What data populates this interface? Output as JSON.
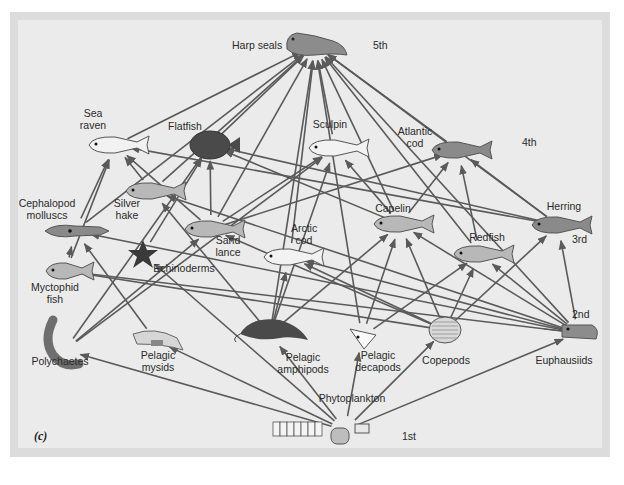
{
  "figure": {
    "panel_label": "(c)",
    "caption_partial": "",
    "colors": {
      "background": "#ebebeb",
      "frame": "#dcdcdc",
      "arrow": "#5a5a5a",
      "text": "#2a2a2a"
    }
  },
  "trophic_levels": [
    {
      "label": "5th",
      "x": 373,
      "y": 49
    },
    {
      "label": "4th",
      "x": 522,
      "y": 146
    },
    {
      "label": "3rd",
      "x": 572,
      "y": 243
    },
    {
      "label": "2nd",
      "x": 572,
      "y": 318
    },
    {
      "label": "1st",
      "x": 402,
      "y": 440
    }
  ],
  "nodes": [
    {
      "id": "harp_seals",
      "label": "Harp seals",
      "icon": "seal-icon",
      "x": 315,
      "y": 45,
      "lx": 232,
      "ly": 49,
      "anchor": "start",
      "level": 5
    },
    {
      "id": "sea_raven",
      "label": "Sea|raven",
      "icon": "fish-icon",
      "x": 115,
      "y": 145,
      "lx": 93,
      "ly": 117,
      "anchor": "middle",
      "level": 4
    },
    {
      "id": "flatfish",
      "label": "Flatfish",
      "icon": "flatfish-icon",
      "x": 210,
      "y": 145,
      "lx": 185,
      "ly": 130,
      "anchor": "middle",
      "level": 4
    },
    {
      "id": "sculpin",
      "label": "Sculpin",
      "icon": "fish-icon",
      "x": 335,
      "y": 148,
      "lx": 330,
      "ly": 128,
      "anchor": "middle",
      "level": 4
    },
    {
      "id": "atlantic_cod",
      "label": "Atlantic|cod",
      "icon": "fish-icon",
      "x": 458,
      "y": 150,
      "lx": 415,
      "ly": 135,
      "anchor": "middle",
      "level": 4
    },
    {
      "id": "cephalopod",
      "label": "Cephalopod|molluscs",
      "icon": "squid-icon",
      "x": 75,
      "y": 231,
      "lx": 47,
      "ly": 207,
      "anchor": "middle",
      "level": 3
    },
    {
      "id": "silver_hake",
      "label": "Silver|hake",
      "icon": "fish-icon",
      "x": 152,
      "y": 191,
      "lx": 127,
      "ly": 207,
      "anchor": "middle",
      "level": 3
    },
    {
      "id": "sand_lance",
      "label": "Sand|lance",
      "icon": "fish-icon",
      "x": 211,
      "y": 229,
      "lx": 228,
      "ly": 244,
      "anchor": "middle",
      "level": 3
    },
    {
      "id": "capelin",
      "label": "Capelin",
      "icon": "fish-icon",
      "x": 400,
      "y": 224,
      "lx": 393,
      "ly": 212,
      "anchor": "middle",
      "level": 3
    },
    {
      "id": "arctic_cod",
      "label": "Arctic|cod",
      "icon": "fish-icon",
      "x": 290,
      "y": 257,
      "lx": 304,
      "ly": 232,
      "anchor": "middle",
      "level": 3
    },
    {
      "id": "redfish",
      "label": "Redfish",
      "icon": "fish-icon",
      "x": 480,
      "y": 254,
      "lx": 487,
      "ly": 241,
      "anchor": "middle",
      "level": 3
    },
    {
      "id": "herring",
      "label": "Herring",
      "icon": "fish-icon",
      "x": 558,
      "y": 225,
      "lx": 564,
      "ly": 210,
      "anchor": "middle",
      "level": 3
    },
    {
      "id": "echinoderms",
      "label": "Echinoderms",
      "icon": "starfish-icon",
      "x": 143,
      "y": 254,
      "lx": 184,
      "ly": 272,
      "anchor": "middle",
      "level": 2
    },
    {
      "id": "myctophid",
      "label": "Myctophid|fish",
      "icon": "fish-icon",
      "x": 66,
      "y": 271,
      "lx": 55,
      "ly": 291,
      "anchor": "middle",
      "level": 3
    },
    {
      "id": "polychaetes",
      "label": "Polychaetes",
      "icon": "worm-icon",
      "x": 65,
      "y": 350,
      "lx": 60,
      "ly": 365,
      "anchor": "middle",
      "level": 2
    },
    {
      "id": "pelagic_mysids",
      "label": "Pelagic|mysids",
      "icon": "shrimp-icon",
      "x": 155,
      "y": 340,
      "lx": 158,
      "ly": 359,
      "anchor": "middle",
      "level": 2
    },
    {
      "id": "pelagic_amphipods",
      "label": "Pelagic|amphipods",
      "icon": "amphipod-icon",
      "x": 270,
      "y": 334,
      "lx": 303,
      "ly": 361,
      "anchor": "middle",
      "level": 2
    },
    {
      "id": "pelagic_decapods",
      "label": "Pelagic|decapods",
      "icon": "decapod-icon",
      "x": 362,
      "y": 337,
      "lx": 378,
      "ly": 359,
      "anchor": "middle",
      "level": 2
    },
    {
      "id": "copepods",
      "label": "Copepods",
      "icon": "copepod-icon",
      "x": 445,
      "y": 330,
      "lx": 446,
      "ly": 364,
      "anchor": "middle",
      "level": 2
    },
    {
      "id": "euphausiids",
      "label": "Euphausiids",
      "icon": "krill-icon",
      "x": 578,
      "y": 333,
      "lx": 564,
      "ly": 364,
      "anchor": "middle",
      "level": 2
    },
    {
      "id": "phytoplankton",
      "label": "Phytoplankton",
      "icon": "phytoplankton-icon",
      "x": 345,
      "y": 430,
      "lx": 352,
      "ly": 402,
      "anchor": "middle",
      "level": 1
    }
  ],
  "edges": [
    [
      "sea_raven",
      "harp_seals"
    ],
    [
      "flatfish",
      "harp_seals"
    ],
    [
      "sculpin",
      "harp_seals"
    ],
    [
      "atlantic_cod",
      "harp_seals"
    ],
    [
      "silver_hake",
      "harp_seals"
    ],
    [
      "sand_lance",
      "harp_seals"
    ],
    [
      "capelin",
      "harp_seals"
    ],
    [
      "arctic_cod",
      "harp_seals"
    ],
    [
      "redfish",
      "harp_seals"
    ],
    [
      "herring",
      "harp_seals"
    ],
    [
      "cephalopod",
      "harp_seals"
    ],
    [
      "euphausiids",
      "harp_seals"
    ],
    [
      "pelagic_amphipods",
      "harp_seals"
    ],
    [
      "pelagic_decapods",
      "harp_seals"
    ],
    [
      "cephalopod",
      "sea_raven"
    ],
    [
      "myctophid",
      "sea_raven"
    ],
    [
      "silver_hake",
      "sea_raven"
    ],
    [
      "sand_lance",
      "sea_raven"
    ],
    [
      "polychaetes",
      "flatfish"
    ],
    [
      "sand_lance",
      "flatfish"
    ],
    [
      "echinoderms",
      "flatfish"
    ],
    [
      "capelin",
      "flatfish"
    ],
    [
      "sand_lance",
      "sculpin"
    ],
    [
      "pelagic_amphipods",
      "sculpin"
    ],
    [
      "polychaetes",
      "sculpin"
    ],
    [
      "capelin",
      "sculpin"
    ],
    [
      "capelin",
      "atlantic_cod"
    ],
    [
      "herring",
      "atlantic_cod"
    ],
    [
      "sand_lance",
      "atlantic_cod"
    ],
    [
      "redfish",
      "atlantic_cod"
    ],
    [
      "herring",
      "sea_raven"
    ],
    [
      "herring",
      "flatfish"
    ],
    [
      "myctophid",
      "cephalopod"
    ],
    [
      "euphausiids",
      "cephalopod"
    ],
    [
      "pelagic_mysids",
      "cephalopod"
    ],
    [
      "euphausiids",
      "myctophid"
    ],
    [
      "copepods",
      "myctophid"
    ],
    [
      "pelagic_amphipods",
      "silver_hake"
    ],
    [
      "euphausiids",
      "silver_hake"
    ],
    [
      "copepods",
      "sand_lance"
    ],
    [
      "polychaetes",
      "sand_lance"
    ],
    [
      "copepods",
      "capelin"
    ],
    [
      "euphausiids",
      "capelin"
    ],
    [
      "pelagic_amphipods",
      "capelin"
    ],
    [
      "pelagic_decapods",
      "capelin"
    ],
    [
      "copepods",
      "arctic_cod"
    ],
    [
      "euphausiids",
      "arctic_cod"
    ],
    [
      "pelagic_amphipods",
      "arctic_cod"
    ],
    [
      "copepods",
      "redfish"
    ],
    [
      "euphausiids",
      "redfish"
    ],
    [
      "pelagic_decapods",
      "redfish"
    ],
    [
      "copepods",
      "herring"
    ],
    [
      "euphausiids",
      "herring"
    ],
    [
      "phytoplankton",
      "polychaetes"
    ],
    [
      "phytoplankton",
      "pelagic_mysids"
    ],
    [
      "phytoplankton",
      "pelagic_amphipods"
    ],
    [
      "phytoplankton",
      "pelagic_decapods"
    ],
    [
      "phytoplankton",
      "copepods"
    ],
    [
      "phytoplankton",
      "euphausiids"
    ],
    [
      "phytoplankton",
      "echinoderms"
    ]
  ]
}
